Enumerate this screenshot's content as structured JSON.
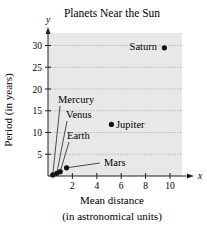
{
  "chart_data": {
    "type": "scatter",
    "title": "Planets Near the Sun",
    "xlabel": "Mean distance",
    "xlabel_sub": "(in astronomical units)",
    "ylabel": "Period (in years)",
    "x_axis_symbol": "x",
    "y_axis_symbol": "y",
    "xlim": [
      0,
      11
    ],
    "ylim": [
      0,
      32
    ],
    "x_ticks": [
      2,
      4,
      6,
      8,
      10
    ],
    "y_ticks": [
      5,
      10,
      15,
      20,
      25,
      30
    ],
    "grid": {
      "horizontal": true,
      "vertical": false
    },
    "background": "#e8e8e8",
    "points": [
      {
        "name": "Mercury",
        "x": 0.39,
        "y": 0.24
      },
      {
        "name": "Venus",
        "x": 0.72,
        "y": 0.62
      },
      {
        "name": "Earth",
        "x": 1.0,
        "y": 1.0
      },
      {
        "name": "Mars",
        "x": 1.52,
        "y": 1.88
      },
      {
        "name": "Jupiter",
        "x": 5.2,
        "y": 11.86
      },
      {
        "name": "Saturn",
        "x": 9.54,
        "y": 29.46
      }
    ]
  }
}
